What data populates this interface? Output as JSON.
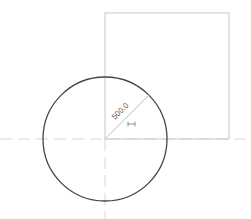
{
  "drawing": {
    "colors": {
      "background": "#ffffff",
      "circle_stroke": "#444444",
      "square_stroke": "#c8c8c8",
      "dimension_line": "#bdbdbd",
      "centerline": "#d6d6d6",
      "label": "#555555"
    },
    "circle": {
      "cx": 105,
      "cy": 139,
      "r": 62
    },
    "square": {
      "x": 105,
      "y": 13,
      "width": 124,
      "height": 126
    },
    "centerlines": {
      "horizontal_y": 139,
      "vertical_x": 105
    },
    "radius_dimension": {
      "value_label": "500.0",
      "angle_deg": -45,
      "from": [
        105,
        139
      ],
      "to": [
        149,
        95
      ]
    },
    "constraint_marker": {
      "glyph": "horizontal-distance-icon",
      "x": 129,
      "y": 121
    }
  }
}
